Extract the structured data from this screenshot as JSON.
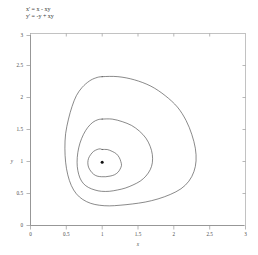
{
  "figure": {
    "equations": [
      "x' = x - xy",
      "y' = -y + xy"
    ],
    "xlabel": "x",
    "ylabel": "y",
    "background_color": "#ffffff",
    "curve_color": "#4a4a4a",
    "axis_color": "#8c8c8c",
    "frame_color": "#a9a9a9",
    "point_color": "#101010"
  },
  "axes": {
    "x_ticks": [
      "0",
      "0.5",
      "1",
      "1.5",
      "2",
      "2.5",
      "3"
    ],
    "y_ticks": [
      "0",
      "0.5",
      "1",
      "1.5",
      "2",
      "2.5",
      "3"
    ]
  },
  "chart_data": {
    "type": "line",
    "xlabel": "x",
    "ylabel": "y",
    "xlim": [
      0,
      3
    ],
    "ylim": [
      0,
      3
    ],
    "xticks": [
      0,
      0.5,
      1,
      1.5,
      2,
      2.5,
      3
    ],
    "yticks": [
      0,
      0.5,
      1,
      1.5,
      2,
      2.5,
      3
    ],
    "grid": false,
    "legend": "none",
    "annotations": [
      {
        "label": "center equilibrium",
        "x": 1.0,
        "y": 1.0,
        "marker": "filled-dot"
      }
    ],
    "series": [
      {
        "name": "outer orbit",
        "closed": true,
        "x": [
          1.0,
          1.22,
          1.45,
          1.68,
          1.88,
          2.05,
          2.17,
          2.25,
          2.3,
          2.31,
          2.28,
          2.21,
          2.1,
          1.95,
          1.78,
          1.6,
          1.42,
          1.25,
          1.1,
          0.96,
          0.84,
          0.73,
          0.64,
          0.57,
          0.52,
          0.49,
          0.48,
          0.49,
          0.53,
          0.58,
          0.64,
          0.72,
          0.82,
          0.91,
          0.98
        ],
        "y": [
          2.35,
          2.35,
          2.3,
          2.2,
          2.05,
          1.87,
          1.66,
          1.44,
          1.22,
          1.02,
          0.85,
          0.7,
          0.58,
          0.49,
          0.42,
          0.37,
          0.34,
          0.32,
          0.31,
          0.32,
          0.35,
          0.41,
          0.5,
          0.63,
          0.8,
          1.0,
          1.22,
          1.45,
          1.68,
          1.88,
          2.05,
          2.18,
          2.28,
          2.33,
          2.35
        ]
      },
      {
        "name": "middle orbit",
        "closed": true,
        "x": [
          1.0,
          1.14,
          1.28,
          1.41,
          1.52,
          1.61,
          1.67,
          1.7,
          1.7,
          1.67,
          1.61,
          1.53,
          1.43,
          1.32,
          1.21,
          1.1,
          0.99,
          0.9,
          0.81,
          0.74,
          0.69,
          0.66,
          0.65,
          0.66,
          0.69,
          0.74,
          0.8,
          0.87,
          0.94,
          0.99
        ],
        "y": [
          1.68,
          1.68,
          1.64,
          1.58,
          1.49,
          1.38,
          1.25,
          1.12,
          0.99,
          0.88,
          0.78,
          0.7,
          0.64,
          0.59,
          0.56,
          0.54,
          0.54,
          0.56,
          0.6,
          0.66,
          0.75,
          0.87,
          1.0,
          1.15,
          1.3,
          1.44,
          1.55,
          1.63,
          1.67,
          1.68
        ]
      },
      {
        "name": "inner orbit",
        "closed": true,
        "x": [
          1.0,
          1.07,
          1.14,
          1.2,
          1.24,
          1.26,
          1.27,
          1.25,
          1.22,
          1.17,
          1.11,
          1.05,
          0.99,
          0.93,
          0.88,
          0.84,
          0.81,
          0.8,
          0.81,
          0.84,
          0.88,
          0.93,
          0.97,
          1.0
        ],
        "y": [
          1.2,
          1.2,
          1.17,
          1.13,
          1.07,
          1.01,
          0.95,
          0.89,
          0.84,
          0.8,
          0.78,
          0.77,
          0.77,
          0.78,
          0.81,
          0.86,
          0.92,
          0.99,
          1.06,
          1.12,
          1.17,
          1.2,
          1.21,
          1.2
        ]
      }
    ]
  }
}
